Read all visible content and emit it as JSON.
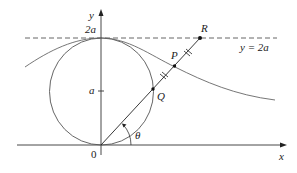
{
  "figure": {
    "axis_labels": {
      "x": "x",
      "y": "y"
    },
    "origin_label": "0",
    "y_ticks": {
      "a": "a",
      "two_a": "2a"
    },
    "dashed_line_label": "y = 2a",
    "points": {
      "R": "R",
      "P": "P",
      "Q": "Q"
    },
    "angle_label": "θ"
  }
}
